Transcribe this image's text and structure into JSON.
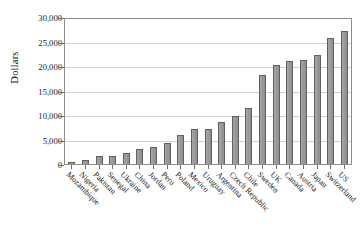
{
  "chart_data": {
    "type": "bar",
    "title": "",
    "subtitle": "",
    "xlabel": "",
    "ylabel": "Dollars",
    "ylim": [
      0,
      30000
    ],
    "yticks": [
      "0",
      "5,000",
      "10,000",
      "15,000",
      "20,000",
      "25,000",
      "30,000"
    ],
    "ytick_values": [
      0,
      5000,
      10000,
      15000,
      20000,
      25000,
      30000
    ],
    "grid": "horizontal",
    "legend": "none",
    "bar_color": "#9d9d9d",
    "bar_edge_color": "#5f5f5f",
    "axis_color": "#8c8c8c",
    "gridline_color": "#cfcfcf",
    "categories": [
      "Mozambique",
      "Nigeria",
      "Pakistan",
      "Senegal",
      "Ukraine",
      "China",
      "Jordan",
      "Peru",
      "Poland",
      "Mexico",
      "Uruguay",
      "Argentina",
      "Czech Republic",
      "Chile",
      "Sweden",
      "UK",
      "Canada",
      "Austria",
      "Japan",
      "Switzerland",
      "US"
    ],
    "values": [
      400,
      800,
      1700,
      1600,
      2200,
      3200,
      3600,
      4400,
      5900,
      7200,
      7300,
      8700,
      9900,
      11500,
      18500,
      20500,
      21300,
      21600,
      22600,
      26000,
      27500
    ]
  }
}
